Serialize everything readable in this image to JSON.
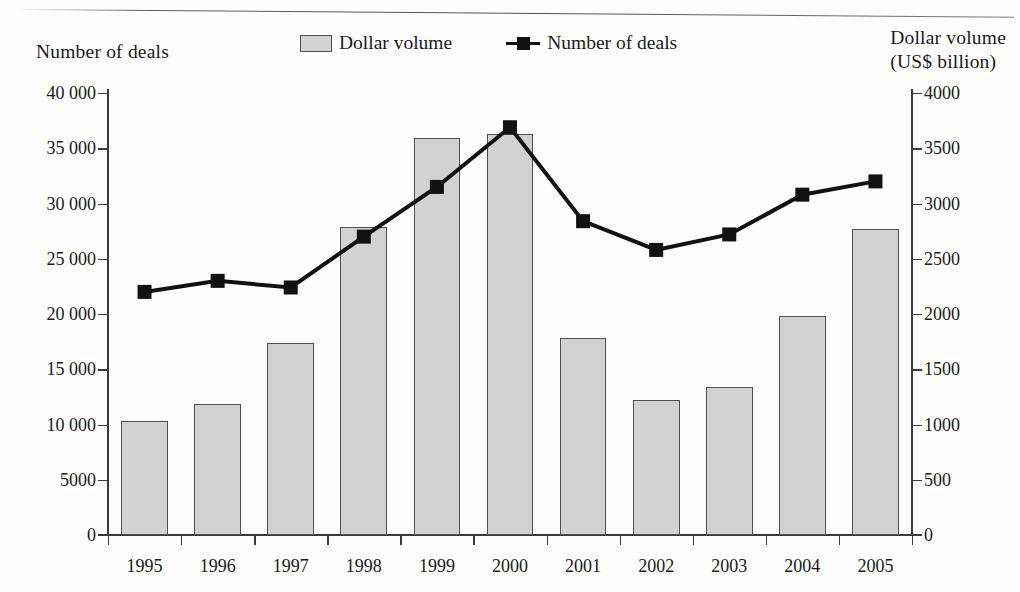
{
  "figure": {
    "left_axis_title": "Number of deals",
    "right_axis_title": "Dollar volume\n(US$ billion)"
  },
  "legend": {
    "position": "top-center",
    "entries": [
      {
        "label": "Dollar volume",
        "marker": "bar-swatch-icon",
        "color": "#d2d2d2"
      },
      {
        "label": "Number of deals",
        "marker": "line-square-marker-icon",
        "color": "#111111"
      }
    ]
  },
  "chart_data": {
    "type": "bar",
    "title": "",
    "subtitle": "",
    "xlabel": "",
    "ylabel": "Number of deals",
    "y2label": "Dollar volume (US$ billion)",
    "grid": false,
    "legend_position": "top-center",
    "categories": [
      "1995",
      "1996",
      "1997",
      "1998",
      "1999",
      "2000",
      "2001",
      "2002",
      "2003",
      "2004",
      "2005"
    ],
    "x_tick_labels": [
      "1995",
      "1996",
      "1997",
      "1998",
      "1999",
      "2000",
      "2001",
      "2002",
      "2003",
      "2004",
      "2005"
    ],
    "ylim": [
      0,
      40000
    ],
    "y_tick_labels": [
      "0",
      "5000",
      "10 000",
      "15 000",
      "20 000",
      "25 000",
      "30 000",
      "35 000",
      "40 000"
    ],
    "y_ticks": [
      0,
      5000,
      10000,
      15000,
      20000,
      25000,
      30000,
      35000,
      40000
    ],
    "y2lim": [
      0,
      4000
    ],
    "y2_tick_labels": [
      "0",
      "500",
      "1000",
      "1500",
      "2000",
      "2500",
      "3000",
      "3500",
      "4000"
    ],
    "y2_ticks": [
      0,
      500,
      1000,
      1500,
      2000,
      2500,
      3000,
      3500,
      4000
    ],
    "series": [
      {
        "name": "Dollar volume",
        "type": "bar",
        "axis": "right",
        "unit": "US$ billion",
        "color": "#d2d2d2",
        "edge_color": "#4f4f4f",
        "values": [
          1030,
          1190,
          1740,
          2790,
          3590,
          3630,
          1780,
          1220,
          1340,
          1980,
          2770
        ]
      },
      {
        "name": "Number of deals",
        "type": "line",
        "axis": "left",
        "unit": "deals",
        "color": "#111111",
        "marker": "square",
        "values": [
          22000,
          23000,
          22400,
          27000,
          31500,
          36900,
          28400,
          25800,
          27200,
          30800,
          32000
        ]
      }
    ]
  }
}
